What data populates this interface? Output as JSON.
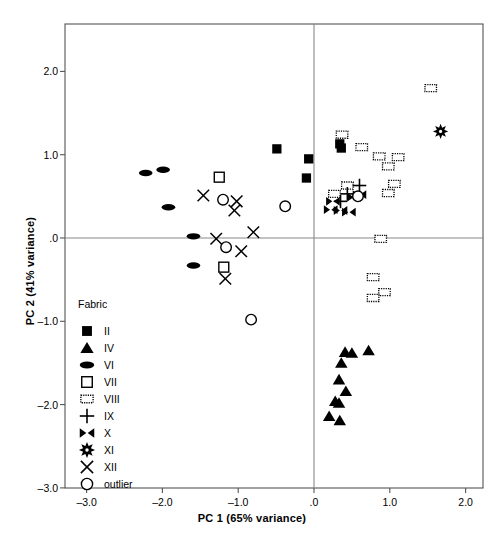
{
  "chart_data": {
    "type": "scatter",
    "title": "",
    "xlabel": "PC 1 (65% variance)",
    "ylabel": "PC 2 (41% variance)",
    "xlim": [
      -3.28,
      2.22
    ],
    "ylim": [
      -3.0,
      2.55
    ],
    "xticks": [
      "-3.0",
      "-2.0",
      "-1.0",
      ".0",
      "1.0",
      "2.0"
    ],
    "xtick_values": [
      -3.0,
      -2.0,
      -1.0,
      0.0,
      1.0,
      2.0
    ],
    "yticks": [
      "2.0",
      "1.0",
      ".0",
      "-1.0",
      "-2.0",
      "-3.0"
    ],
    "ytick_values": [
      2.0,
      1.0,
      0.0,
      -1.0,
      -2.0,
      -3.0
    ],
    "grid": false,
    "reference_lines": {
      "x": 0.0,
      "y": 0.0
    },
    "legend_title": "Fabric",
    "legend_position": "lower-left-inside",
    "series": [
      {
        "name": "II",
        "marker": "filled-square",
        "points": [
          [
            -0.49,
            1.07
          ],
          [
            -0.07,
            0.95
          ],
          [
            -0.1,
            0.72
          ],
          [
            0.34,
            1.13
          ],
          [
            0.36,
            1.08
          ]
        ]
      },
      {
        "name": "IV",
        "marker": "filled-triangle",
        "points": [
          [
            0.41,
            -1.37
          ],
          [
            0.5,
            -1.38
          ],
          [
            0.72,
            -1.35
          ],
          [
            0.36,
            -1.5
          ],
          [
            0.33,
            -1.7
          ],
          [
            0.42,
            -1.84
          ],
          [
            0.28,
            -1.96
          ],
          [
            0.33,
            -1.98
          ],
          [
            0.2,
            -2.14
          ],
          [
            0.34,
            -2.19
          ]
        ]
      },
      {
        "name": "VI",
        "marker": "filled-ellipse",
        "points": [
          [
            -2.22,
            0.78
          ],
          [
            -1.99,
            0.82
          ],
          [
            -1.92,
            0.37
          ],
          [
            -1.59,
            0.02
          ],
          [
            -1.59,
            -0.33
          ]
        ]
      },
      {
        "name": "VII",
        "marker": "open-square",
        "points": [
          [
            -1.25,
            0.73
          ],
          [
            -1.19,
            -0.35
          ]
        ]
      },
      {
        "name": "VIII",
        "marker": "dotted-square",
        "points": [
          [
            1.54,
            1.8
          ],
          [
            0.37,
            1.24
          ],
          [
            0.63,
            1.09
          ],
          [
            0.86,
            0.98
          ],
          [
            1.11,
            0.97
          ],
          [
            0.98,
            0.86
          ],
          [
            0.44,
            0.63
          ],
          [
            1.06,
            0.65
          ],
          [
            0.98,
            0.54
          ],
          [
            0.27,
            0.53
          ],
          [
            0.88,
            -0.01
          ],
          [
            0.78,
            -0.47
          ],
          [
            0.93,
            -0.65
          ],
          [
            0.78,
            -0.72
          ]
        ]
      },
      {
        "name": "IX",
        "marker": "plus",
        "points": [
          [
            0.6,
            0.63
          ],
          [
            0.44,
            0.53
          ],
          [
            0.35,
            0.44
          ]
        ]
      },
      {
        "name": "X",
        "marker": "bowtie",
        "points": [
          [
            0.25,
            0.44
          ],
          [
            0.53,
            0.49
          ],
          [
            0.6,
            0.52
          ],
          [
            0.22,
            0.34
          ],
          [
            0.35,
            0.33
          ],
          [
            0.46,
            0.31
          ]
        ]
      },
      {
        "name": "XI",
        "marker": "star",
        "points": [
          [
            1.67,
            1.28
          ]
        ]
      },
      {
        "name": "XII",
        "marker": "cross",
        "points": [
          [
            -1.46,
            0.51
          ],
          [
            -1.02,
            0.44
          ],
          [
            -1.05,
            0.33
          ],
          [
            -0.8,
            0.07
          ],
          [
            -1.29,
            -0.01
          ],
          [
            -0.96,
            -0.16
          ],
          [
            -1.17,
            -0.49
          ]
        ]
      },
      {
        "name": "outlier",
        "marker": "open-circle",
        "points": [
          [
            -1.2,
            0.46
          ],
          [
            -0.38,
            0.38
          ],
          [
            -1.16,
            -0.11
          ],
          [
            -0.83,
            -0.98
          ],
          [
            0.58,
            0.5
          ]
        ]
      }
    ]
  },
  "legend": {
    "title": "Fabric",
    "items": [
      {
        "label": "II",
        "marker": "filled-square"
      },
      {
        "label": "IV",
        "marker": "filled-triangle"
      },
      {
        "label": "VI",
        "marker": "filled-ellipse"
      },
      {
        "label": "VII",
        "marker": "open-square"
      },
      {
        "label": "VIII",
        "marker": "dotted-square"
      },
      {
        "label": "IX",
        "marker": "plus"
      },
      {
        "label": "X",
        "marker": "bowtie"
      },
      {
        "label": "XI",
        "marker": "star"
      },
      {
        "label": "XII",
        "marker": "cross"
      },
      {
        "label": "outlier",
        "marker": "open-circle"
      }
    ]
  },
  "colors": {
    "marker": "#000000",
    "frame": "#555555",
    "reference_line": "#888888",
    "background": "#ffffff"
  }
}
